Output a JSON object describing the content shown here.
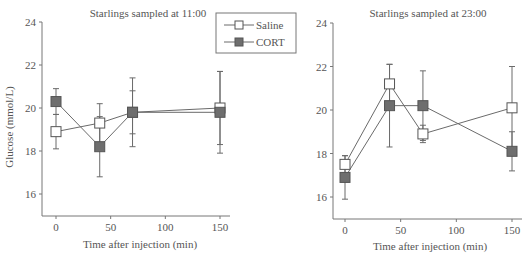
{
  "chart_data": [
    {
      "type": "line",
      "title": "Starlings sampled at 11:00",
      "xlabel": "Time after injection (min)",
      "ylabel": "Glucose (mmol/L)",
      "x": [
        0,
        40,
        70,
        150
      ],
      "xticks": [
        0,
        50,
        100,
        150
      ],
      "yticks": [
        16,
        18,
        20,
        22,
        24
      ],
      "xlim": [
        -10,
        160
      ],
      "ylim": [
        15,
        24
      ],
      "grid": false,
      "legend_position": "upper right",
      "series": [
        {
          "name": "Saline",
          "marker": "open-square",
          "values": [
            18.9,
            19.3,
            19.8,
            20.0
          ],
          "err": [
            0.8,
            0.9,
            1.6,
            1.7
          ]
        },
        {
          "name": "CORT",
          "marker": "filled-square",
          "values": [
            20.3,
            18.2,
            19.8,
            19.8
          ],
          "err": [
            0.6,
            1.4,
            1.0,
            1.9
          ]
        }
      ]
    },
    {
      "type": "line",
      "title": "Starlings sampled at 23:00",
      "xlabel": "Time after injection (min)",
      "ylabel": "",
      "x": [
        0,
        40,
        70,
        150
      ],
      "xticks": [
        0,
        50,
        100,
        150
      ],
      "yticks": [
        16,
        18,
        20,
        22,
        24
      ],
      "xlim": [
        -10,
        160
      ],
      "ylim": [
        15,
        24
      ],
      "grid": false,
      "series": [
        {
          "name": "Saline",
          "marker": "open-square",
          "values": [
            17.5,
            21.2,
            18.9,
            20.1
          ],
          "err": [
            0.4,
            0.9,
            0.4,
            1.9
          ]
        },
        {
          "name": "CORT",
          "marker": "filled-square",
          "values": [
            16.9,
            20.2,
            20.2,
            18.1
          ],
          "err": [
            1.0,
            1.9,
            1.6,
            0.9
          ]
        }
      ]
    }
  ],
  "legend": {
    "items": [
      {
        "label": "Saline",
        "marker": "open-square"
      },
      {
        "label": "CORT",
        "marker": "filled-square"
      }
    ]
  },
  "colors": {
    "axis": "#777777",
    "line": "#6a6a6a",
    "text": "#555555",
    "open_fill": "#ffffff",
    "filled_fill": "#6e6e6e"
  }
}
